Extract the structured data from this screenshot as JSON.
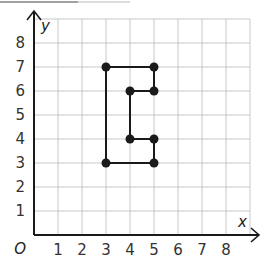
{
  "chart_data": {
    "type": "scatter",
    "title": "",
    "xlabel": "x",
    "ylabel": "y",
    "origin_label": "O",
    "xlim": [
      0,
      9
    ],
    "ylim": [
      0,
      9
    ],
    "grid": true,
    "x_ticks": [
      "1",
      "2",
      "3",
      "4",
      "5",
      "6",
      "7",
      "8"
    ],
    "y_ticks": [
      "1",
      "2",
      "3",
      "4",
      "5",
      "6",
      "7",
      "8"
    ],
    "x_tick_values": [
      1,
      2,
      3,
      4,
      5,
      6,
      7,
      8
    ],
    "y_tick_values": [
      1,
      2,
      3,
      4,
      5,
      6,
      7,
      8
    ],
    "series": [
      {
        "name": "polygon",
        "closed": true,
        "points": [
          {
            "x": 3,
            "y": 7
          },
          {
            "x": 5,
            "y": 7
          },
          {
            "x": 5,
            "y": 6
          },
          {
            "x": 4,
            "y": 6
          },
          {
            "x": 4,
            "y": 4
          },
          {
            "x": 5,
            "y": 4
          },
          {
            "x": 5,
            "y": 3
          },
          {
            "x": 3,
            "y": 3
          }
        ]
      }
    ],
    "colors": {
      "grid": "#c8c8c8",
      "axis": "#1a1a1a",
      "shape": "#1a1a1a",
      "text": "#333333"
    }
  }
}
